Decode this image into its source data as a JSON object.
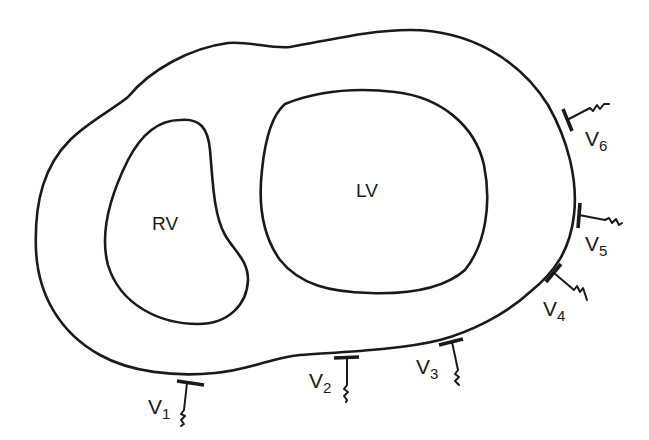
{
  "diagram": {
    "stroke_color": "#1a1a1a",
    "background": "#ffffff",
    "chambers": [
      {
        "id": "rv",
        "label": "RV",
        "name": "Right ventricle"
      },
      {
        "id": "lv",
        "label": "LV",
        "name": "Left ventricle"
      }
    ],
    "leads": [
      {
        "id": "v1",
        "prefix": "V",
        "number": "1"
      },
      {
        "id": "v2",
        "prefix": "V",
        "number": "2"
      },
      {
        "id": "v3",
        "prefix": "V",
        "number": "3"
      },
      {
        "id": "v4",
        "prefix": "V",
        "number": "4"
      },
      {
        "id": "v5",
        "prefix": "V",
        "number": "5"
      },
      {
        "id": "v6",
        "prefix": "V",
        "number": "6"
      }
    ]
  }
}
